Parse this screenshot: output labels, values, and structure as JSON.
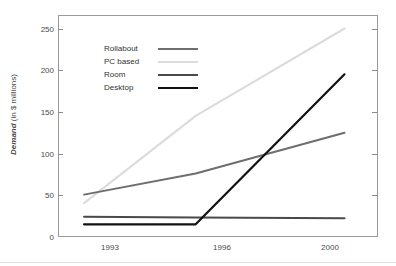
{
  "chart_data": {
    "type": "line",
    "title": "",
    "xlabel": "",
    "ylabel": "Demand (in $ millions)",
    "ylabel_emphasis": "Demand",
    "ylabel_rest": " (in $ millions)",
    "categories": [
      "1993",
      "1996",
      "2000"
    ],
    "x": [
      1993,
      1996,
      2000
    ],
    "xlim": [
      1992.3,
      2000.9
    ],
    "ylim": [
      0,
      262
    ],
    "yticks": [
      0,
      50,
      100,
      150,
      200,
      250
    ],
    "ytick_labels": [
      "0",
      "50",
      "100",
      "150",
      "200",
      "250"
    ],
    "grid": false,
    "legend_position": "upper-left-inside",
    "series": [
      {
        "name": "Rollabout",
        "color": "#6e6e6e",
        "values": [
          50,
          75,
          123
        ]
      },
      {
        "name": "PC based",
        "color": "#dcdcdc",
        "values": [
          40,
          143,
          246
        ]
      },
      {
        "name": "Room",
        "color": "#4a4a4a",
        "values": [
          24,
          23,
          22
        ]
      },
      {
        "name": "Desktop",
        "color": "#111111",
        "values": [
          15,
          15,
          192
        ]
      }
    ]
  },
  "legend": {
    "items": [
      {
        "label": "Rollabout",
        "color": "#6e6e6e"
      },
      {
        "label": "PC based",
        "color": "#dcdcdc"
      },
      {
        "label": "Room",
        "color": "#4a4a4a"
      },
      {
        "label": "Desktop",
        "color": "#111111"
      }
    ]
  },
  "axes": {
    "y_tick_labels": [
      "250",
      "200",
      "150",
      "100",
      "50",
      "0"
    ],
    "x_tick_labels": [
      "1993",
      "1996",
      "2000"
    ]
  }
}
